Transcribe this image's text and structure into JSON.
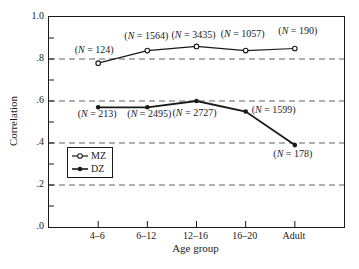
{
  "figure": {
    "background": "#ffffff",
    "ink": "#1a1a1a",
    "grid": "#636363"
  },
  "chart_data": {
    "type": "line",
    "title": "",
    "xlabel": "Age group",
    "ylabel": "Correlation",
    "categories": [
      "4–6",
      "6–12",
      "12–16",
      "16–20",
      "Adult"
    ],
    "ylim": [
      0.0,
      1.0
    ],
    "yticks": [
      {
        "value": 1.0,
        "label": "1.0"
      },
      {
        "value": 0.8,
        "label": ".8"
      },
      {
        "value": 0.6,
        "label": ".6"
      },
      {
        "value": 0.4,
        "label": ".4"
      },
      {
        "value": 0.2,
        "label": ".2"
      },
      {
        "value": 0.0,
        "label": ".0"
      }
    ],
    "minor_yticks": [
      0.9,
      0.7,
      0.5,
      0.3,
      0.1
    ],
    "gridlines_y": [
      0.8,
      0.6,
      0.4,
      0.2
    ],
    "grid_style": "dashed",
    "legend": {
      "position": "middle-left",
      "entries": [
        {
          "label": "MZ",
          "marker": "open-circle"
        },
        {
          "label": "DZ",
          "marker": "filled-circle"
        }
      ]
    },
    "series": [
      {
        "name": "MZ",
        "marker": "open-circle",
        "values": [
          0.78,
          0.84,
          0.86,
          0.84,
          0.85
        ],
        "point_labels": [
          "(N = 124)",
          "(N = 1564)",
          "(N = 3435)",
          "(N = 1057)",
          "(N = 190)"
        ]
      },
      {
        "name": "DZ",
        "marker": "filled-circle",
        "values": [
          0.57,
          0.57,
          0.6,
          0.55,
          0.39
        ],
        "point_labels": [
          "(N = 213)",
          "(N = 2495)",
          "(N = 2727)",
          "(N = 1599)",
          "(N = 178)"
        ]
      }
    ]
  }
}
